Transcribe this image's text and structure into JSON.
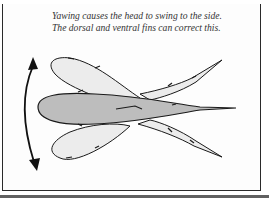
{
  "figure": {
    "caption": "Yawing causes the head to swing to the side. The dorsal and ventral fins can correct this.",
    "colors": {
      "body_fill": "#bdbdbd",
      "fin_fill": "#ececec",
      "outline": "#1a1a1a",
      "border": "#2a2a2a"
    },
    "annotations": {
      "arrow": "curved-double-headed-arrow"
    }
  }
}
